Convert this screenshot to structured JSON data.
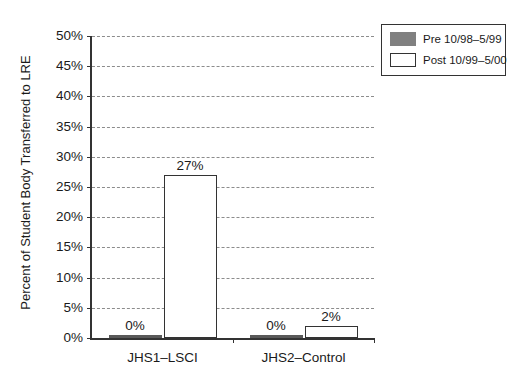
{
  "chart_data": {
    "type": "bar",
    "title": "Transfers to Less Restrictive Environment",
    "xlabel": "",
    "ylabel": "Percent of Student Body Transferred to LRE",
    "categories": [
      "JHS1–LSCI",
      "JHS2–Control"
    ],
    "series": [
      {
        "name": "Pre 10/98–5/99",
        "color": "#595959",
        "values": [
          0,
          0
        ],
        "labels": [
          "0%",
          "0%"
        ]
      },
      {
        "name": "Post 10/99–5/00",
        "color": "#ffffff",
        "values": [
          27,
          2
        ],
        "labels": [
          "27%",
          "2%"
        ]
      }
    ],
    "ylim": [
      0,
      50
    ],
    "ytick_step": 5,
    "ytick_labels": [
      "50%",
      "45%",
      "40%",
      "35%",
      "30%",
      "25%",
      "20%",
      "15%",
      "10%",
      "5%",
      "0%"
    ],
    "ytick_values": [
      50,
      45,
      40,
      35,
      30,
      25,
      20,
      15,
      10,
      5,
      0
    ],
    "grid": true,
    "grid_style": "dashed",
    "legend_position": "top-right"
  },
  "legend": {
    "entries": [
      {
        "label": "Pre 10/98–5/99",
        "swatch": "filled-gray"
      },
      {
        "label": "Post 10/99–5/00",
        "swatch": "outlined-white"
      }
    ]
  },
  "colors": {
    "bar_pre": "#595959",
    "bar_post_fill": "#ffffff",
    "bar_post_border": "#333333",
    "axis": "#333333",
    "grid": "#8c8c8c",
    "text": "#1a1a1a",
    "legend_swatch_pre": "#808080"
  }
}
